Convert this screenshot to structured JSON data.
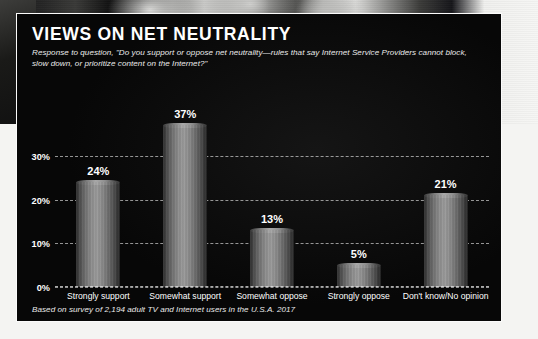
{
  "panel": {
    "title": "VIEWS ON NET NEUTRALITY",
    "subtitle": "Response to question, \"Do you support or oppose net neutrality—rules that say Internet Service Providers cannot block, slow down, or prioritize content on the Internet?\"",
    "footnote": "Based on survey of 2,194 adult TV and Internet users in the U.S.A. 2017"
  },
  "chart_data": {
    "type": "bar",
    "title": "VIEWS ON NET NEUTRALITY",
    "subtitle": "Response to question, \"Do you support or oppose net neutrality—rules that say Internet Service Providers cannot block, slow down, or prioritize content on the Internet?\"",
    "categories": [
      "Strongly support",
      "Somewhat support",
      "Somewhat oppose",
      "Strongly oppose",
      "Don't know/No opinion"
    ],
    "values": [
      24,
      37,
      13,
      5,
      21
    ],
    "value_labels": [
      "24%",
      "37%",
      "13%",
      "5%",
      "21%"
    ],
    "xlabel": "",
    "ylabel": "",
    "ylim": [
      0,
      40
    ],
    "yticks": [
      0,
      10,
      20,
      30
    ],
    "ytick_labels": [
      "0%",
      "10%",
      "20%",
      "30%"
    ],
    "grid": true,
    "legend": "none",
    "bar_style": "cylinder",
    "colors": {
      "panel_background": "#0a0a0a",
      "panel_border": "#fbfbfb",
      "text": "#ffffff",
      "gridline": "#ebebeb",
      "bar_light": "#9b9b9b",
      "bar_dark": "#232323"
    }
  }
}
